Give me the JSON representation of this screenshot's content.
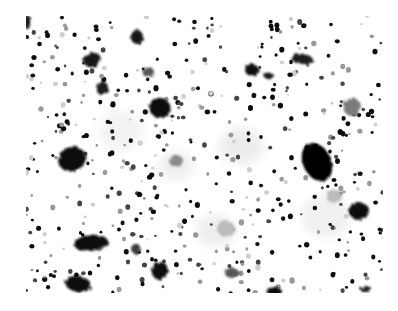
{
  "image": {
    "description": "Grayscale speckle image of dark particles and blobs on white background",
    "frame": {
      "x": 26,
      "y": 16,
      "width": 357,
      "height": 277
    },
    "background": "#ffffff",
    "colors": {
      "dark": "#0a0a0a",
      "mid": "#3a3a3a",
      "light": "#9a9a9a",
      "faint": "#d6d6d6"
    }
  },
  "blobs": [
    {
      "cx": 46,
      "cy": 143,
      "rx": 14,
      "ry": 12,
      "color": "#0a0a0a",
      "rot": -20
    },
    {
      "cx": 291,
      "cy": 146,
      "rx": 14,
      "ry": 20,
      "color": "#050505",
      "rot": -25
    },
    {
      "cx": 333,
      "cy": 195,
      "rx": 10,
      "ry": 9,
      "color": "#0a0a0a",
      "rot": 0
    },
    {
      "cx": 65,
      "cy": 227,
      "rx": 17,
      "ry": 8,
      "color": "#0a0a0a",
      "rot": -5
    },
    {
      "cx": 52,
      "cy": 268,
      "rx": 13,
      "ry": 8,
      "color": "#0a0a0a",
      "rot": 10
    },
    {
      "cx": 134,
      "cy": 255,
      "rx": 8,
      "ry": 9,
      "color": "#111111",
      "rot": 20
    },
    {
      "cx": 66,
      "cy": 44,
      "rx": 9,
      "ry": 7,
      "color": "#151515",
      "rot": -20
    },
    {
      "cx": 134,
      "cy": 92,
      "rx": 11,
      "ry": 10,
      "color": "#101010",
      "rot": 30
    },
    {
      "cx": 76,
      "cy": 72,
      "rx": 6,
      "ry": 7,
      "color": "#1a1a1a",
      "rot": 0
    },
    {
      "cx": 111,
      "cy": 21,
      "rx": 6,
      "ry": 7,
      "color": "#151515",
      "rot": 0
    },
    {
      "cx": 276,
      "cy": 43,
      "rx": 11,
      "ry": 5,
      "color": "#1a1a1a",
      "rot": 5
    },
    {
      "cx": 226,
      "cy": 54,
      "rx": 7,
      "ry": 6,
      "color": "#111111",
      "rot": 0
    },
    {
      "cx": 243,
      "cy": 60,
      "rx": 6,
      "ry": 3,
      "color": "#1a1a1a",
      "rot": 10
    },
    {
      "cx": 326,
      "cy": 91,
      "rx": 9,
      "ry": 9,
      "color": "#7a7a7a",
      "rot": 0
    },
    {
      "cx": 1,
      "cy": 6,
      "rx": 4,
      "ry": 7,
      "color": "#1a1a1a",
      "rot": 0
    },
    {
      "cx": 122,
      "cy": 56,
      "rx": 6,
      "ry": 5,
      "color": "#555555",
      "rot": 0
    },
    {
      "cx": 308,
      "cy": 180,
      "rx": 8,
      "ry": 7,
      "color": "#bbbbbb",
      "rot": 0
    },
    {
      "cx": 200,
      "cy": 213,
      "rx": 9,
      "ry": 8,
      "color": "#bbbbbb",
      "rot": 0
    },
    {
      "cx": 206,
      "cy": 257,
      "rx": 7,
      "ry": 5,
      "color": "#555555",
      "rot": 0
    },
    {
      "cx": 248,
      "cy": 276,
      "rx": 8,
      "ry": 5,
      "color": "#0a0a0a",
      "rot": 0
    },
    {
      "cx": 340,
      "cy": 273,
      "rx": 6,
      "ry": 3,
      "color": "#1a1a1a",
      "rot": 0
    },
    {
      "cx": 150,
      "cy": 145,
      "rx": 7,
      "ry": 6,
      "color": "#8a8a8a",
      "rot": 0
    },
    {
      "cx": 110,
      "cy": 233,
      "rx": 5,
      "ry": 5,
      "color": "#3a3a3a",
      "rot": 0
    }
  ],
  "faint_clouds": [
    {
      "cx": 215,
      "cy": 130,
      "rx": 22,
      "ry": 18,
      "color": "#ececec"
    },
    {
      "cx": 190,
      "cy": 215,
      "rx": 20,
      "ry": 16,
      "color": "#eeeeee"
    },
    {
      "cx": 300,
      "cy": 200,
      "rx": 25,
      "ry": 22,
      "color": "#f0f0f0"
    },
    {
      "cx": 150,
      "cy": 150,
      "rx": 18,
      "ry": 14,
      "color": "#efefef"
    },
    {
      "cx": 95,
      "cy": 115,
      "rx": 22,
      "ry": 20,
      "color": "#f3f3f3"
    }
  ],
  "dots_seed": 1337,
  "dots_count": 520
}
